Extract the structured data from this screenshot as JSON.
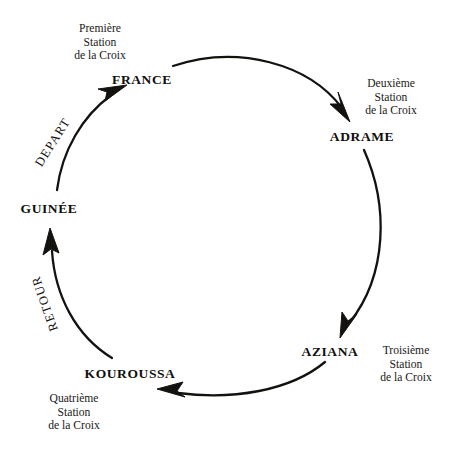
{
  "diagram": {
    "type": "cycle",
    "title": "",
    "nodes": [
      {
        "id": "france",
        "label": "FRANCE",
        "x": 142,
        "y": 80,
        "align": "center"
      },
      {
        "id": "adrame",
        "label": "ADRAME",
        "x": 362,
        "y": 137,
        "align": "center"
      },
      {
        "id": "aziana",
        "label": "AZIANA",
        "x": 330,
        "y": 352,
        "align": "center"
      },
      {
        "id": "kouroussa",
        "label": "KOUROUSSA",
        "x": 130,
        "y": 374,
        "align": "center"
      },
      {
        "id": "guinee",
        "label": "GUINÉE",
        "x": 49,
        "y": 209,
        "align": "center"
      }
    ],
    "station_labels": [
      {
        "id": "premiere",
        "lines": [
          "Première",
          "Station",
          "de la Croix"
        ],
        "x": 100,
        "y": 39,
        "align": "center"
      },
      {
        "id": "deuxieme",
        "lines": [
          "Deuxième",
          "Station",
          "de la Croix"
        ],
        "x": 391,
        "y": 94,
        "align": "center"
      },
      {
        "id": "troisieme",
        "lines": [
          "Troisième",
          "Station",
          "de la Croix"
        ],
        "x": 406,
        "y": 367,
        "align": "center"
      },
      {
        "id": "quatrieme",
        "lines": [
          "Quatrième",
          "Station",
          "de la Croix"
        ],
        "x": 74,
        "y": 409,
        "align": "center"
      }
    ],
    "arc_captions": [
      {
        "id": "depart",
        "label": "DEPART",
        "x": 53,
        "y": 142,
        "rotation": -58
      },
      {
        "id": "retour",
        "label": "RETOUR",
        "x": 45,
        "y": 303,
        "rotation": -109
      }
    ],
    "arrows": [
      {
        "id": "arrow-france-adrame",
        "from": "france",
        "to": "adrame"
      },
      {
        "id": "arrow-adrame-aziana",
        "from": "adrame",
        "to": "aziana"
      },
      {
        "id": "arrow-aziana-kouroussa",
        "from": "aziana",
        "to": "kouroussa"
      },
      {
        "id": "arrow-kouroussa-guinee",
        "from": "kouroussa",
        "to": "guinee"
      },
      {
        "id": "arrow-guinee-france",
        "from": "guinee",
        "to": "france"
      }
    ],
    "colors": {
      "background": "#ffffff",
      "ink": "#100f0d",
      "stroke": "#14120f"
    }
  }
}
